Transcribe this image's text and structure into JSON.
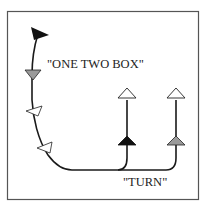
{
  "diagram": {
    "labels": {
      "one_two_box": "\"ONE TWO BOX\"",
      "turn": "\"TURN\""
    },
    "colors": {
      "line": "#1a1a1a",
      "frame": "#555555",
      "black_marker": "#111111",
      "gray_marker": "#9a9a9a",
      "white_marker": "#ffffff"
    },
    "markers": [
      {
        "name": "start-flag",
        "fill": "black",
        "direction": "right"
      },
      {
        "name": "marker-one",
        "fill": "gray",
        "direction": "down"
      },
      {
        "name": "marker-two",
        "fill": "white",
        "direction": "left"
      },
      {
        "name": "marker-box",
        "fill": "white",
        "direction": "left"
      },
      {
        "name": "turn-left-branch",
        "fill": "black",
        "direction": "up"
      },
      {
        "name": "turn-right-branch",
        "fill": "gray",
        "direction": "up"
      },
      {
        "name": "end-left",
        "fill": "white",
        "direction": "up"
      },
      {
        "name": "end-right",
        "fill": "white",
        "direction": "up"
      }
    ]
  }
}
